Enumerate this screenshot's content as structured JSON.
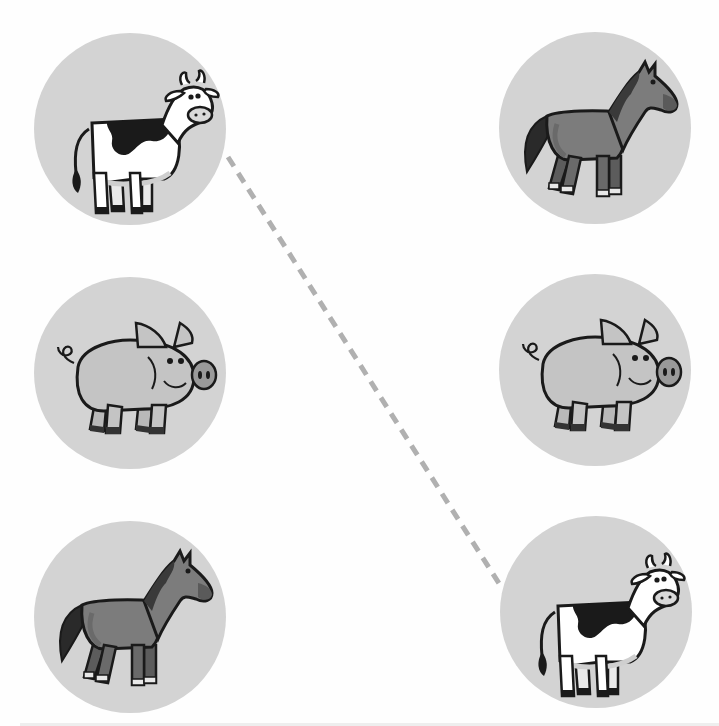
{
  "activity": {
    "type": "matching",
    "colors": {
      "background": "#fefefe",
      "circle": "#d3d3d3",
      "connector": "#b0b0b0",
      "outline": "#1a1a1a"
    },
    "left_column": [
      {
        "animal": "cow",
        "label": "Cow"
      },
      {
        "animal": "pig",
        "label": "Pig"
      },
      {
        "animal": "horse",
        "label": "Horse"
      }
    ],
    "right_column": [
      {
        "animal": "horse",
        "label": "Horse"
      },
      {
        "animal": "pig",
        "label": "Pig"
      },
      {
        "animal": "cow",
        "label": "Cow"
      }
    ],
    "connections": [
      {
        "from": "left.0",
        "to": "right.2",
        "style": "dashed"
      }
    ]
  }
}
